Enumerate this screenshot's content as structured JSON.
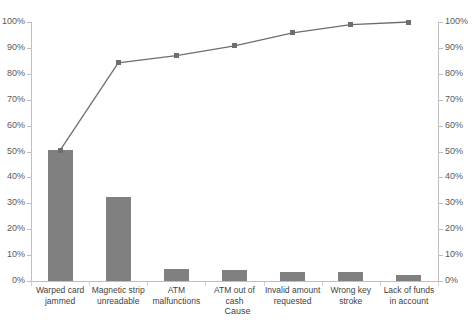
{
  "chart_data": {
    "type": "bar",
    "title": "",
    "subtitle": "",
    "xlabel": "Cause",
    "ylabel": "",
    "ylim": [
      0,
      100
    ],
    "y2lim": [
      0,
      100
    ],
    "grid": false,
    "legend": "none",
    "categories": [
      "Warped card jammed",
      "Magnetic strip unreadable",
      "ATM malfunctions",
      "ATM out of cash",
      "Invalid amount requested",
      "Wrong key stroke",
      "Lack of funds in account"
    ],
    "series": [
      {
        "name": "Frequency",
        "type": "bar",
        "axis": "left",
        "values": [
          50.4,
          32.5,
          4.6,
          4.2,
          3.5,
          3.5,
          2.3
        ]
      },
      {
        "name": "Cumulative percentage",
        "type": "line",
        "axis": "right",
        "values": [
          50.4,
          84.2,
          87.0,
          90.8,
          95.8,
          99.0,
          100.0
        ]
      }
    ],
    "y_tick_labels": [
      "100%",
      "90%",
      "80%",
      "70%",
      "60%",
      "50%",
      "40%",
      "30%",
      "20%",
      "10%",
      "0%"
    ],
    "y_tick_values": [
      100,
      90,
      80,
      70,
      60,
      50,
      40,
      30,
      20,
      10,
      0
    ],
    "y2_tick_labels": [
      "100%",
      "90%",
      "80%",
      "70%",
      "60%",
      "50%",
      "40%",
      "30%",
      "20%",
      "10%",
      "0%"
    ],
    "y2_tick_values": [
      100,
      90,
      80,
      70,
      60,
      50,
      40,
      30,
      20,
      10,
      0
    ],
    "colors": {
      "bar": "#808080",
      "line": "#6e6e6e",
      "marker": "#6e6e6e",
      "axis": "#bfbfbf",
      "text": "#3f3f3f",
      "tick_text": "#5a5a5a",
      "background": "#ffffff"
    }
  }
}
